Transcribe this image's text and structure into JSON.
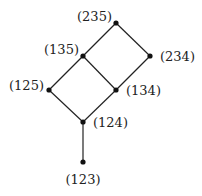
{
  "diagram": {
    "type": "hasse-diagram",
    "nodes": [
      {
        "id": "235",
        "label": "(235)"
      },
      {
        "id": "135",
        "label": "(135)"
      },
      {
        "id": "234",
        "label": "(234)"
      },
      {
        "id": "125",
        "label": "(125)"
      },
      {
        "id": "134",
        "label": "(134)"
      },
      {
        "id": "124",
        "label": "(124)"
      },
      {
        "id": "123",
        "label": "(123)"
      }
    ],
    "edges": [
      [
        "235",
        "135"
      ],
      [
        "235",
        "234"
      ],
      [
        "135",
        "125"
      ],
      [
        "135",
        "134"
      ],
      [
        "234",
        "134"
      ],
      [
        "125",
        "124"
      ],
      [
        "134",
        "124"
      ],
      [
        "124",
        "123"
      ]
    ]
  }
}
